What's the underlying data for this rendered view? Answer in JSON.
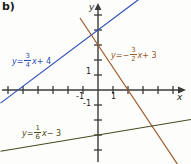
{
  "figure": {
    "panel_label": "b)",
    "background_color": "#fdfdfb",
    "width": 191,
    "height": 164
  },
  "axes": {
    "x_label": "x",
    "y_label": "y",
    "x_tick_labels": [
      {
        "text": "-1",
        "value": -1
      },
      {
        "text": "1",
        "value": 1
      }
    ],
    "y_tick_labels": [
      {
        "text": "1",
        "value": 1
      },
      {
        "text": "-1",
        "value": -1
      }
    ],
    "origin_px": {
      "x": 98,
      "y": 90
    },
    "unit_px": 15,
    "axis_color": "#3a3a3a",
    "xlim": [
      -6.5,
      6.2
    ],
    "ylim": [
      -5.0,
      6.0
    ]
  },
  "chart_data": {
    "type": "line",
    "title": "",
    "xlabel": "x",
    "ylabel": "y",
    "grid": false,
    "legend": "inline-annotations",
    "xlim": [
      -6.5,
      6.2
    ],
    "ylim": [
      -5.0,
      6.0
    ],
    "series": [
      {
        "name": "blue-line",
        "equation": "y = 3/4 x + 4",
        "slope": 0.75,
        "intercept": 4,
        "color": "#2f4fb5",
        "label_parts": {
          "lhs": "y",
          "eq": "=",
          "sign": "",
          "num": "3",
          "den": "4",
          "var": "x",
          "tail": "+ 4"
        },
        "points": [
          [
            -6.5,
            -0.875
          ],
          [
            6.2,
            8.65
          ]
        ]
      },
      {
        "name": "brown-line",
        "equation": "y = -3/2 x + 3",
        "slope": -1.5,
        "intercept": 3,
        "color": "#9a5a2a",
        "label_parts": {
          "lhs": "y",
          "eq": "=",
          "sign": "−",
          "num": "3",
          "den": "2",
          "var": "x",
          "tail": "+ 3"
        },
        "points": [
          [
            -1.2,
            4.8
          ],
          [
            6.2,
            -6.3
          ]
        ]
      },
      {
        "name": "olive-line",
        "equation": "y = 1/6 x - 3",
        "slope": 0.16666,
        "intercept": -3,
        "color": "#4a4a20",
        "label_parts": {
          "lhs": "y",
          "eq": "=",
          "sign": "",
          "num": "1",
          "den": "6",
          "var": "x",
          "tail": "− 3"
        },
        "points": [
          [
            -6.5,
            -4.083
          ],
          [
            6.2,
            -1.967
          ]
        ]
      }
    ]
  }
}
